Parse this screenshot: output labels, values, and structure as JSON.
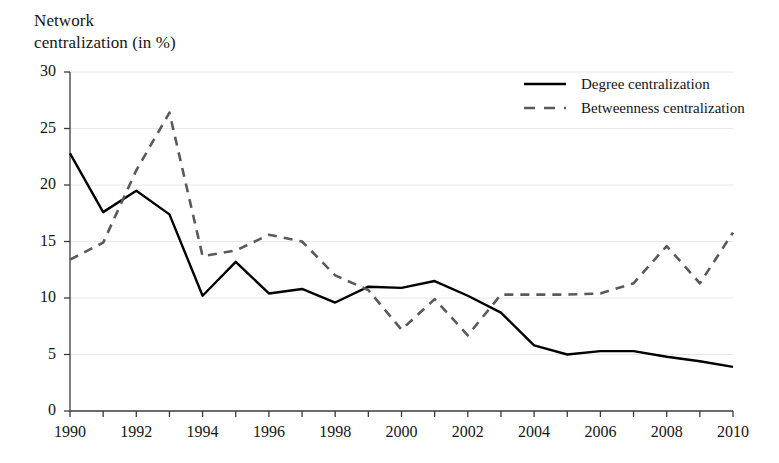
{
  "chart_data": {
    "type": "line",
    "title": "Network\ncentralization (in %)",
    "xlabel": "",
    "ylabel": "Network centralization (in %)",
    "x": [
      1990,
      1991,
      1992,
      1993,
      1994,
      1995,
      1996,
      1997,
      1998,
      1999,
      2000,
      2001,
      2002,
      2003,
      2004,
      2005,
      2006,
      2007,
      2008,
      2009,
      2010
    ],
    "categories": [
      "1990",
      "1991",
      "1992",
      "1993",
      "1994",
      "1995",
      "1996",
      "1997",
      "1998",
      "1999",
      "2000",
      "2001",
      "2002",
      "2003",
      "2004",
      "2005",
      "2006",
      "2007",
      "2008",
      "2009",
      "2010"
    ],
    "series": [
      {
        "name": "Degree centralization",
        "style": "solid",
        "color": "#000000",
        "values": [
          22.8,
          17.6,
          19.5,
          17.4,
          10.2,
          13.2,
          10.4,
          10.8,
          9.6,
          11.0,
          10.9,
          11.5,
          10.2,
          8.7,
          5.8,
          5.0,
          5.3,
          5.3,
          4.8,
          4.4,
          3.9
        ]
      },
      {
        "name": "Betweenness centralization",
        "style": "dashed",
        "color": "#5a5a5a",
        "values": [
          13.4,
          14.9,
          21.3,
          26.4,
          13.7,
          14.2,
          15.6,
          15.0,
          12.0,
          10.7,
          7.2,
          9.9,
          6.7,
          10.3,
          10.3,
          10.3,
          10.4,
          11.3,
          14.6,
          11.3,
          15.8
        ]
      }
    ],
    "ylim": [
      0,
      30
    ],
    "yticks": [
      0,
      5,
      10,
      15,
      20,
      25,
      30
    ],
    "ytick_labels": [
      "0",
      "5",
      "10",
      "15",
      "20",
      "25",
      "30"
    ],
    "xlim": [
      1990,
      2010
    ],
    "xticks": [
      1990,
      1991,
      1992,
      1993,
      1994,
      1995,
      1996,
      1997,
      1998,
      1999,
      2000,
      2001,
      2002,
      2003,
      2004,
      2005,
      2006,
      2007,
      2008,
      2009,
      2010
    ],
    "xtick_labels_shown": [
      "1990",
      "1992",
      "1994",
      "1996",
      "1998",
      "2000",
      "2002",
      "2004",
      "2006",
      "2008",
      "2010"
    ],
    "xtick_label_step": 2,
    "grid": true,
    "grid_color": "#e8e8ea",
    "legend_position": "top-right",
    "legend": [
      "Degree centralization",
      "Betweenness centralization"
    ],
    "background": "#ffffff",
    "axis_color": "#3a3a3a"
  }
}
